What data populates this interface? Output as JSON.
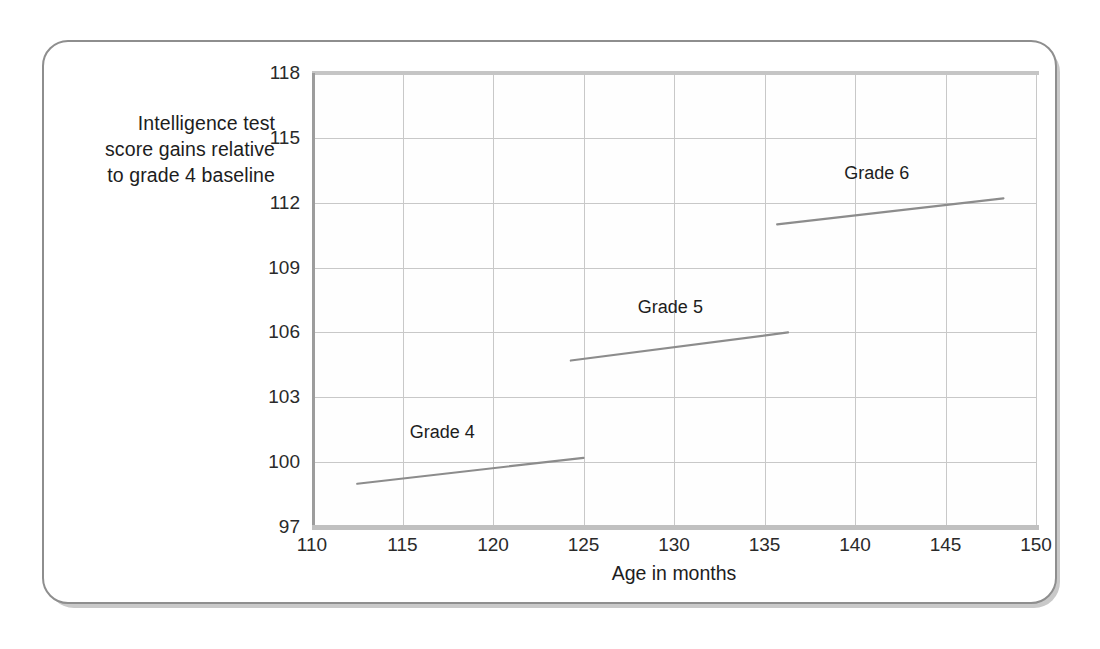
{
  "figure": {
    "y_axis_title_lines": [
      "Intelligence test",
      "score gains relative",
      "to grade 4 baseline"
    ],
    "y_axis_title": "Intelligence test score gains relative to grade 4 baseline",
    "x_axis_title": "Age in months"
  },
  "colors": {
    "line": "#8c8c8c",
    "grid": "#c8c8c8",
    "axis": "#9c9c9c",
    "text": "#1d1d1d",
    "card_border": "#8e8e8e",
    "background": "#ffffff"
  },
  "chart_data": {
    "type": "line",
    "title": "",
    "xlabel": "Age in months",
    "ylabel": "Intelligence test score gains relative to grade 4 baseline",
    "xlim": [
      110,
      150
    ],
    "ylim": [
      97,
      118
    ],
    "xticks": [
      110,
      115,
      120,
      125,
      130,
      135,
      140,
      145,
      150
    ],
    "yticks": [
      97,
      100,
      103,
      106,
      109,
      112,
      115,
      118
    ],
    "grid": true,
    "legend": "inline-labels",
    "series": [
      {
        "name": "Grade 4",
        "label": "Grade 4",
        "x": [
          112.5,
          125.0
        ],
        "y": [
          99.0,
          100.2
        ],
        "label_x": 117.2,
        "label_y": 101.3
      },
      {
        "name": "Grade 5",
        "label": "Grade 5",
        "x": [
          124.3,
          136.3
        ],
        "y": [
          104.7,
          106.0
        ],
        "label_x": 129.8,
        "label_y": 107.1
      },
      {
        "name": "Grade 6",
        "label": "Grade 6",
        "x": [
          135.7,
          148.2
        ],
        "y": [
          111.0,
          112.2
        ],
        "label_x": 141.2,
        "label_y": 113.3
      }
    ]
  }
}
